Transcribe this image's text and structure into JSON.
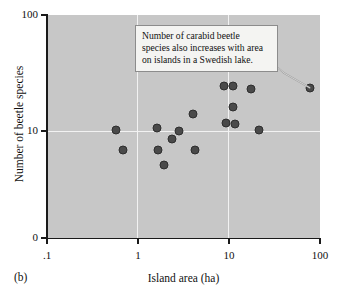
{
  "figure": {
    "panel_label": "(b)"
  },
  "chart_data": {
    "type": "scatter",
    "title": "",
    "xlabel": "Island area (ha)",
    "ylabel": "Number of beetle species",
    "xscale": "log",
    "yscale": "log",
    "xlim": [
      0.1,
      100
    ],
    "ylim": [
      0,
      100
    ],
    "grid": true,
    "legend": null,
    "xtick_labels": [
      ".1",
      "1",
      "10",
      "100"
    ],
    "xtick_values": [
      0.1,
      1,
      10,
      100
    ],
    "ytick_labels": [
      "0",
      "10",
      "100"
    ],
    "ytick_values": [
      0,
      10,
      100
    ],
    "gridlines_x": [
      1,
      10
    ],
    "gridlines_y": [
      10
    ],
    "marker_color": "#4a4a4a",
    "panel_background": "#c7c7c7",
    "points": [
      {
        "x": 0.58,
        "y": 10.2
      },
      {
        "x": 0.68,
        "y": 6.9
      },
      {
        "x": 1.6,
        "y": 10.6
      },
      {
        "x": 1.65,
        "y": 6.8
      },
      {
        "x": 1.95,
        "y": 5.1
      },
      {
        "x": 2.35,
        "y": 8.6
      },
      {
        "x": 2.8,
        "y": 10.0
      },
      {
        "x": 4.0,
        "y": 14.0
      },
      {
        "x": 4.2,
        "y": 6.8
      },
      {
        "x": 8.8,
        "y": 24.5
      },
      {
        "x": 9.2,
        "y": 11.8
      },
      {
        "x": 11.0,
        "y": 24.5
      },
      {
        "x": 11.0,
        "y": 16.0
      },
      {
        "x": 11.5,
        "y": 11.4
      },
      {
        "x": 17.5,
        "y": 23.0
      },
      {
        "x": 21.5,
        "y": 10.2
      },
      {
        "x": 78.0,
        "y": 23.5
      }
    ],
    "annotation": {
      "text": "Number of carabid beetle species also increases with area on islands in a Swedish lake.",
      "lines": [
        "Number of carabid beetle",
        "species also increases with area",
        "on islands in a Swedish lake."
      ],
      "points_to": {
        "x": 78.0,
        "y": 23.5
      }
    }
  }
}
